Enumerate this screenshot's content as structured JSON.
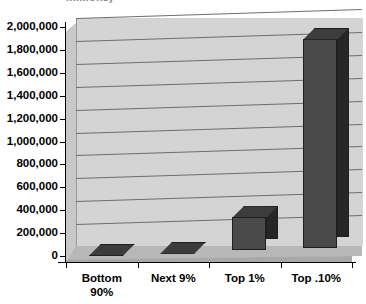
{
  "chart_data": {
    "type": "bar",
    "title": "millions)",
    "title_truncated": true,
    "subtitle": "",
    "xlabel": "",
    "ylabel": "",
    "categories": [
      "Bottom 90%",
      "Next 9%",
      "Top 1%",
      "Top .10%"
    ],
    "values": [
      0,
      0,
      290000,
      1830000
    ],
    "series": [
      {
        "name": "Amount",
        "values": [
          0,
          0,
          290000,
          1830000
        ]
      }
    ],
    "ylim": [
      0,
      2000000
    ],
    "ytick_values": [
      0,
      200000,
      400000,
      600000,
      800000,
      1000000,
      1200000,
      1400000,
      1600000,
      1800000,
      2000000
    ],
    "ytick_labels": [
      "2,000,000",
      "1,800,000",
      "1,600,000",
      "1,400,000",
      "1,200,000",
      "1,000,000",
      "800,000",
      "600,000",
      "400,000",
      "200,000",
      "0"
    ],
    "grid": true,
    "legend": false,
    "legend_position": "none",
    "style": "3d-column",
    "colors": {
      "bar_face": "#4a4a4a",
      "bar_side": "#262626",
      "bar_top": "#3c3c3c",
      "plot_background": "#d4d4d4",
      "floor": "#b8b8b8",
      "gridline": "#6e6e6e",
      "axis": "#000000",
      "text": "#000000"
    }
  },
  "xlabel_lines": [
    [
      "Bottom",
      "90%"
    ],
    [
      "Next 9%",
      ""
    ],
    [
      "Top 1%",
      ""
    ],
    [
      "Top .10%",
      ""
    ]
  ]
}
